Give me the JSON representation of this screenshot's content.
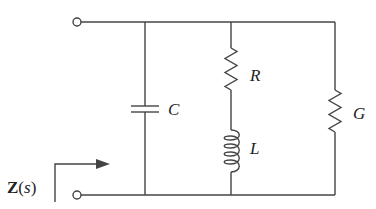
{
  "diagram": {
    "type": "circuit",
    "components": {
      "capacitor": {
        "label": "C"
      },
      "resistor": {
        "label": "R"
      },
      "inductor": {
        "label": "L"
      },
      "conductance": {
        "label": "G"
      }
    },
    "impedance": {
      "bold": "Z",
      "open": "(",
      "var": "s",
      "close": ")"
    },
    "colors": {
      "wire": "#444444",
      "background": "#ffffff"
    }
  }
}
